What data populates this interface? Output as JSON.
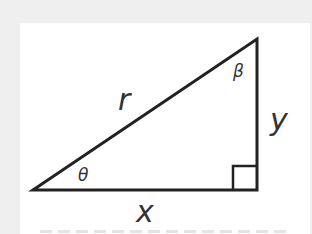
{
  "diagram": {
    "colors": {
      "background": "#efefef",
      "panel": "#ffffff",
      "stroke": "#222222",
      "label": "#333333"
    },
    "vertices": {
      "left": [
        33,
        190
      ],
      "right_angle": [
        257,
        190
      ],
      "top": [
        257,
        39
      ]
    },
    "labels": {
      "hypotenuse": "r",
      "opposite": "y",
      "adjacent": "x",
      "angle_left": "θ",
      "angle_top": "β"
    },
    "right_angle_marker": {
      "size": 24
    }
  }
}
